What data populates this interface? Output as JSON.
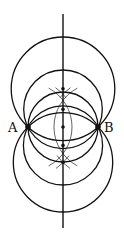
{
  "figure": {
    "type": "geometric-construction",
    "stroke_color": "#111111",
    "background": "#ffffff",
    "points": [
      {
        "label": "A",
        "x": 28,
        "y": 127
      },
      {
        "label": "B",
        "x": 98,
        "y": 127
      }
    ],
    "perpendicular_bisector": {
      "x": 63,
      "y1": 14,
      "y2": 228
    },
    "circles_through_A_and_B": [
      {
        "cx": 63,
        "cy": 88.8,
        "r": 51.8
      },
      {
        "cx": 63,
        "cy": 109.3,
        "r": 39.3
      },
      {
        "cx": 63,
        "cy": 127,
        "r": 35
      },
      {
        "cx": 63,
        "cy": 145.4,
        "r": 39.6
      },
      {
        "cx": 63,
        "cy": 162.3,
        "r": 49.7
      }
    ],
    "center_dots_y": [
      88.8,
      109.3,
      127,
      145.4,
      162.3
    ],
    "construction_arcs": [
      {
        "center": "B",
        "r": 44
      },
      {
        "center": "A",
        "r": 44
      }
    ]
  },
  "labels": {
    "point_a": "A",
    "point_b": "B"
  }
}
